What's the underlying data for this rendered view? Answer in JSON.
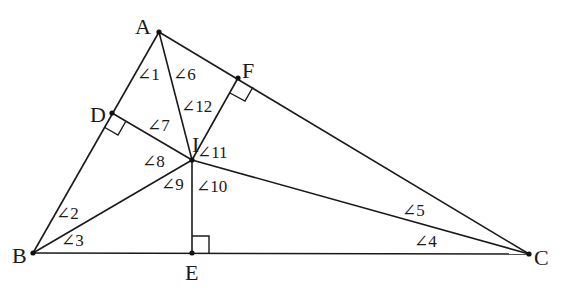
{
  "diagram": {
    "title": "",
    "points": {
      "A": {
        "label": "A",
        "x": 159,
        "y": 32
      },
      "B": {
        "label": "B",
        "x": 33,
        "y": 253
      },
      "C": {
        "label": "C",
        "x": 529,
        "y": 254
      },
      "D": {
        "label": "D",
        "x": 112,
        "y": 113
      },
      "E": {
        "label": "E",
        "x": 192,
        "y": 253
      },
      "F": {
        "label": "F",
        "x": 238,
        "y": 78
      },
      "I": {
        "label": "I",
        "x": 192,
        "y": 160
      }
    },
    "angles": [
      {
        "id": 1,
        "label": "∠1"
      },
      {
        "id": 2,
        "label": "∠2"
      },
      {
        "id": 3,
        "label": "∠3"
      },
      {
        "id": 4,
        "label": "∠4"
      },
      {
        "id": 5,
        "label": "∠5"
      },
      {
        "id": 6,
        "label": "∠6"
      },
      {
        "id": 7,
        "label": "∠7"
      },
      {
        "id": 8,
        "label": "∠8"
      },
      {
        "id": 9,
        "label": "∠9"
      },
      {
        "id": 10,
        "label": "∠10"
      },
      {
        "id": 11,
        "label": "∠11"
      },
      {
        "id": 12,
        "label": "∠12"
      }
    ],
    "segments": [
      "AB",
      "BC",
      "CA",
      "AI",
      "BI",
      "CI",
      "DI",
      "EI",
      "FI"
    ],
    "right_angles": [
      "D",
      "E",
      "F"
    ],
    "colors": {
      "stroke": "#1a1a1a",
      "background": "#ffffff"
    }
  }
}
